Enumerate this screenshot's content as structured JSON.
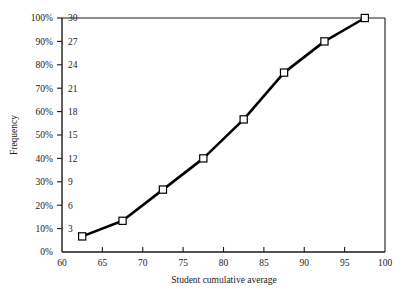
{
  "chart_data": {
    "type": "line",
    "title": "",
    "subtitle": "",
    "xlabel": "Student cumulative average",
    "ylabel": "Frequency",
    "ylabel_secondary": "",
    "x": [
      62.5,
      67.5,
      72.5,
      77.5,
      82.5,
      87.5,
      92.5,
      97.5
    ],
    "values": [
      2,
      4,
      8,
      12,
      17,
      23,
      27,
      30
    ],
    "values_percent": [
      6.7,
      13.3,
      26.7,
      40.0,
      56.7,
      76.7,
      90.0,
      100.0
    ],
    "series": [
      {
        "name": "Cumulative frequency",
        "values": [
          2,
          4,
          8,
          12,
          17,
          23,
          27,
          30
        ]
      }
    ],
    "xlim": [
      60,
      100
    ],
    "ylim": [
      0,
      30
    ],
    "ylim_percent": [
      0,
      100
    ],
    "xticks": [
      60,
      65,
      70,
      75,
      80,
      85,
      90,
      95,
      100
    ],
    "xtick_labels": [
      "60",
      "65",
      "70",
      "75",
      "80",
      "85",
      "90",
      "95",
      "100"
    ],
    "yticks_percent": [
      0,
      10,
      20,
      30,
      40,
      50,
      60,
      70,
      80,
      90,
      100
    ],
    "ytick_labels_percent": [
      "0%",
      "10%",
      "20%",
      "30%",
      "40%",
      "50%",
      "60%",
      "70%",
      "80%",
      "90%",
      "100%"
    ],
    "yticks_freq": [
      3,
      6,
      9,
      12,
      15,
      18,
      21,
      24,
      27,
      30
    ],
    "ytick_labels_freq": [
      "3",
      "6",
      "9",
      "12",
      "15",
      "18",
      "21",
      "24",
      "27",
      "30"
    ],
    "grid": false,
    "legend": false,
    "legend_position": "none",
    "marker": "open-square",
    "line_color": "#000000",
    "marker_fill": "#ffffff",
    "marker_stroke": "#000000",
    "axis_color": "#1a1a1a",
    "background": "#ffffff"
  }
}
